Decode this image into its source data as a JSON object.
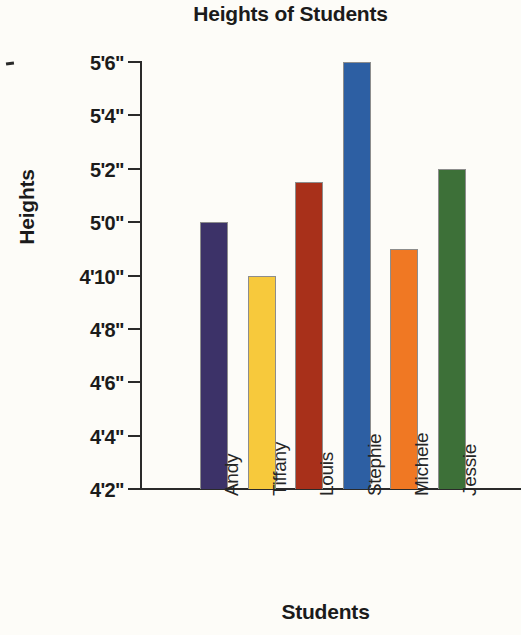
{
  "chart_data": {
    "type": "bar",
    "title": "Heights of Students",
    "xlabel": "Students",
    "ylabel": "Heights",
    "categories": [
      "Andy",
      "Tiffany",
      "Louis",
      "Stephie",
      "Michele",
      "Jessie"
    ],
    "values": [
      60,
      58,
      61.5,
      66,
      59,
      62
    ],
    "value_labels": [
      "5'0\"",
      "4'10\"",
      "5'1.5\"",
      "5'6\"",
      "4'11\"",
      "5'2\""
    ],
    "unit": "inches",
    "ylim": [
      50,
      66
    ],
    "ytick_labels": [
      "5'6\"",
      "5'4\"",
      "5'2\"",
      "5'0\"",
      "4'10\"",
      "4'8\"",
      "4'6\"",
      "4'4\"",
      "4'2\""
    ],
    "ytick_values": [
      66,
      64,
      62,
      60,
      58,
      56,
      54,
      52,
      50
    ],
    "grid": false,
    "legend": false,
    "bar_colors": [
      "#3c3268",
      "#f7c93c",
      "#a8301a",
      "#2d5fa3",
      "#f07823",
      "#3d7038"
    ],
    "series": [
      {
        "name": "Heights",
        "values": [
          60,
          58,
          61.5,
          66,
          59,
          62
        ]
      }
    ]
  },
  "axes": {
    "y_title": "Heights",
    "x_title": "Students"
  },
  "header": {
    "title": "Heights of Students"
  }
}
